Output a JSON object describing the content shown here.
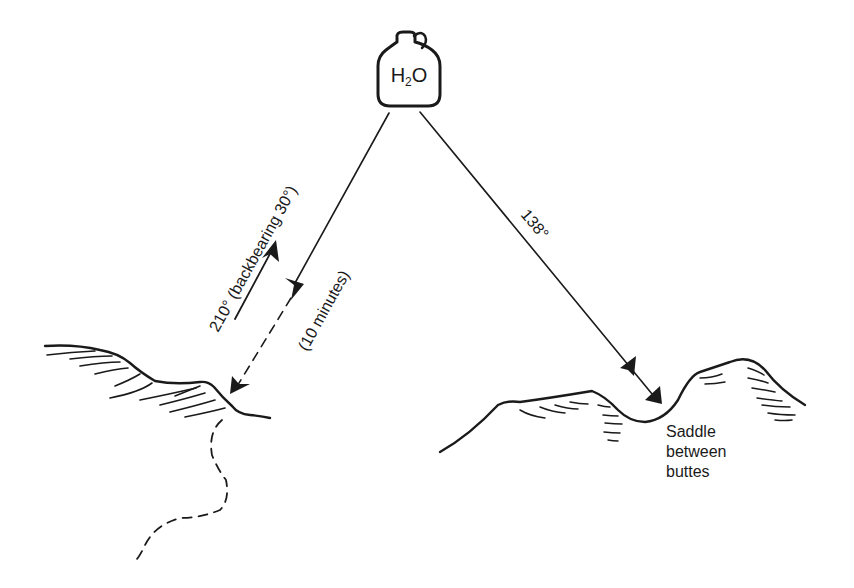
{
  "diagram": {
    "water_jug": {
      "label": "H₂O",
      "label_main": "H",
      "label_sub": "2",
      "label_end": "O",
      "icon": "jug-icon"
    },
    "bearing_left": {
      "label": "210° (backbearing 30°)",
      "duration": "(10 minutes)"
    },
    "bearing_right": {
      "label": "138°"
    },
    "saddle_label": {
      "line1": "Saddle",
      "line2": "between",
      "line3": "buttes"
    },
    "colors": {
      "ink": "#1a1a1a",
      "background": "#ffffff"
    }
  }
}
